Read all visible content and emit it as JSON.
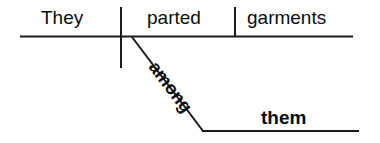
{
  "diagram": {
    "type": "reed-kellogg-sentence-diagram",
    "sentence": "They parted garments among them.",
    "line_color": "#1a1a1a",
    "text_color": "#0c0c0c",
    "background_color": "#ffffff",
    "words": {
      "subject": "They",
      "verb": "parted",
      "direct_object": "garments",
      "preposition": "among",
      "object_of_preposition": "them"
    },
    "lines": {
      "main_baseline": {
        "x1": 20,
        "y1": 36.5,
        "x2": 353,
        "y2": 36.5,
        "width": 2
      },
      "subject_verb_divider": {
        "x1": 121,
        "y1": 7,
        "x2": 121,
        "y2": 68,
        "width": 2
      },
      "verb_object_divider": {
        "x1": 235,
        "y1": 7,
        "x2": 235,
        "y2": 36.5,
        "width": 2
      },
      "preposition_diagonal": {
        "x1": 132,
        "y1": 37,
        "x2": 203,
        "y2": 131,
        "width": 2
      },
      "prep_object_baseline": {
        "x1": 203,
        "y1": 131,
        "x2": 359,
        "y2": 131,
        "width": 2
      }
    }
  }
}
